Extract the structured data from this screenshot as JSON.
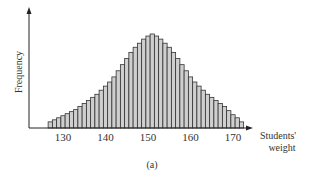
{
  "chart_data": {
    "type": "bar",
    "title": "",
    "subtitle": "",
    "xlabel": "Students' weight",
    "xlabel_lines": [
      "Students'",
      "weight"
    ],
    "ylabel": "Frequency",
    "caption": "(a)",
    "x_ticks": [
      130,
      140,
      150,
      160,
      170
    ],
    "xlim": [
      126.5,
      173.5
    ],
    "ylim": [
      0,
      100
    ],
    "grid": false,
    "legend": null,
    "bar_width": 1,
    "categories": [
      127,
      128,
      129,
      130,
      131,
      132,
      133,
      134,
      135,
      136,
      137,
      138,
      139,
      140,
      141,
      142,
      143,
      144,
      145,
      146,
      147,
      148,
      149,
      150,
      151,
      152,
      153,
      154,
      155,
      156,
      157,
      158,
      159,
      160,
      161,
      162,
      163,
      164,
      165,
      166,
      167,
      168,
      169,
      170,
      171,
      172
    ],
    "values": [
      6,
      8,
      10,
      12,
      14,
      16,
      18,
      21,
      24,
      27,
      30,
      33,
      37,
      41,
      45,
      50,
      56,
      62,
      68,
      74,
      79,
      83,
      87,
      90,
      92,
      90,
      87,
      83,
      79,
      74,
      68,
      62,
      56,
      50,
      45,
      41,
      37,
      33,
      30,
      27,
      24,
      21,
      17,
      13,
      10,
      6
    ],
    "bar_fill": "#cfcfcf",
    "bar_stroke": "#333333"
  }
}
